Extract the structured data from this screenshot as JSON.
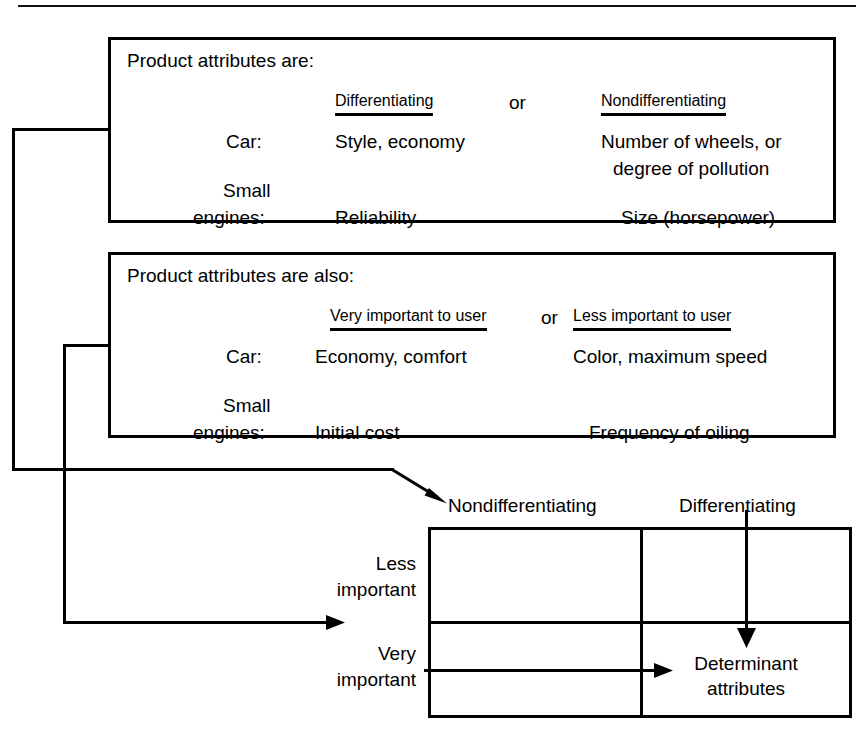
{
  "figure": {
    "boxes": [
      {
        "id": "differentiating",
        "lead": "Product attributes are:",
        "headers": [
          "Differentiating",
          "Nondifferentiating"
        ],
        "conjunction": "or",
        "rows": [
          {
            "label": "Car:",
            "label2": "",
            "values": [
              "Style, economy",
              "Number of wheels, or"
            ]
          },
          {
            "label": "Small",
            "label2": "engines:",
            "values": [
              "Reliability",
              "Size (horsepower)"
            ]
          }
        ],
        "extra_value": "degree of pollution"
      },
      {
        "id": "importance",
        "lead": "Product attributes are also:",
        "headers": [
          "Very important to user",
          "Less important to user"
        ],
        "conjunction": "or",
        "rows": [
          {
            "label": "Car:",
            "label2": "",
            "values": [
              "Economy, comfort",
              "Color, maximum speed"
            ]
          },
          {
            "label": "Small",
            "label2": "engines:",
            "values": [
              "Initial cost",
              "Frequency of oiling"
            ]
          }
        ],
        "extra_value": ""
      }
    ],
    "matrix": {
      "column_headers": [
        "Nondifferentiating",
        "Differentiating"
      ],
      "row_headers": [
        {
          "line1": "Less",
          "line2": "important"
        },
        {
          "line1": "Very",
          "line2": "important"
        }
      ],
      "cells": [
        [
          "",
          ""
        ],
        [
          "",
          "Determinant\nattributes"
        ]
      ],
      "highlight_label_line1": "Determinant",
      "highlight_label_line2": "attributes"
    },
    "stroke_color": "#000000",
    "background_color": "#ffffff"
  }
}
